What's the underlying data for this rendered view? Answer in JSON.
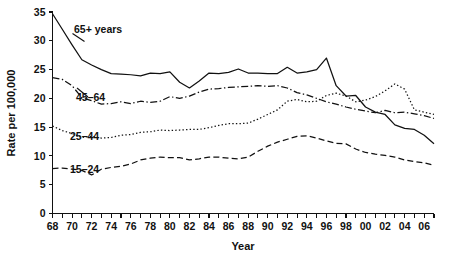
{
  "chart_data": {
    "type": "line",
    "title": "",
    "xlabel": "Year",
    "ylabel": "Rate per 100,000",
    "ylim": [
      0,
      35
    ],
    "xlim": [
      1968,
      2007
    ],
    "grid": false,
    "legend_position": "inline-labels",
    "y_ticks": [
      "0",
      "5",
      "10",
      "15",
      "20",
      "25",
      "30",
      "35"
    ],
    "y_tick_values": [
      0,
      5,
      10,
      15,
      20,
      25,
      30,
      35
    ],
    "x_ticks": [
      "68",
      "70",
      "72",
      "74",
      "76",
      "78",
      "80",
      "82",
      "84",
      "86",
      "88",
      "90",
      "92",
      "94",
      "96",
      "98",
      "00",
      "02",
      "04",
      "06"
    ],
    "x_tick_values": [
      1968,
      1970,
      1972,
      1974,
      1976,
      1978,
      1980,
      1982,
      1984,
      1986,
      1988,
      1990,
      1992,
      1994,
      1996,
      1998,
      2000,
      2002,
      2004,
      2006
    ],
    "x": [
      1968,
      1969,
      1970,
      1971,
      1972,
      1973,
      1974,
      1975,
      1976,
      1977,
      1978,
      1979,
      1980,
      1981,
      1982,
      1983,
      1984,
      1985,
      1986,
      1987,
      1988,
      1989,
      1990,
      1991,
      1992,
      1993,
      1994,
      1995,
      1996,
      1997,
      1998,
      1999,
      2000,
      2001,
      2002,
      2003,
      2004,
      2005,
      2006,
      2007
    ],
    "series": [
      {
        "name": "65+ years",
        "label": "65+ years",
        "style": "solid",
        "color": "#111111",
        "values": [
          34.7,
          32.0,
          29.3,
          26.7,
          25.8,
          25.0,
          24.3,
          24.2,
          24.1,
          23.9,
          24.4,
          24.3,
          24.6,
          22.8,
          21.8,
          23.0,
          24.4,
          24.3,
          24.5,
          25.1,
          24.4,
          24.4,
          24.3,
          24.3,
          25.4,
          24.4,
          24.6,
          25.0,
          27.0,
          22.2,
          20.4,
          20.5,
          18.5,
          17.6,
          17.2,
          15.4,
          14.8,
          14.1,
          14.7,
          15.2
        ],
        "final_values_note": [
          14.6,
          14.0,
          12.1
        ],
        "values_tail": [
          14.6,
          13.6,
          12.1
        ]
      },
      {
        "name": "45-64",
        "label": "45–64",
        "style": "dashdot",
        "color": "#111111",
        "values": [
          23.6,
          23.3,
          22.2,
          20.1,
          19.6,
          19.0,
          19.1,
          19.4,
          19.1,
          19.5,
          19.3,
          19.5,
          20.3,
          20.0,
          20.4,
          21.1,
          21.6,
          21.7,
          21.9,
          22.0,
          22.1,
          22.2,
          22.1,
          22.2,
          21.8,
          21.0,
          20.6,
          20.0,
          19.4,
          19.0,
          18.5,
          18.1,
          17.8,
          17.5,
          17.9,
          17.5,
          17.6,
          17.3,
          17.0,
          16.5
        ]
      },
      {
        "name": "25-44",
        "label": "25–44",
        "style": "dotted",
        "color": "#111111",
        "values": [
          15.2,
          14.4,
          13.9,
          13.2,
          13.4,
          13.1,
          13.2,
          13.6,
          13.7,
          14.1,
          14.2,
          14.5,
          14.4,
          14.5,
          14.6,
          14.6,
          14.9,
          15.3,
          15.6,
          15.6,
          15.7,
          16.4,
          17.2,
          18.0,
          19.5,
          19.8,
          19.4,
          19.5,
          20.5,
          20.9,
          20.4,
          19.4,
          19.7,
          20.3,
          21.3,
          22.5,
          21.6,
          20.8,
          19.9,
          18.4
        ],
        "values_tail": [
          18.0,
          17.6,
          17.2
        ]
      },
      {
        "name": "15-24",
        "label": "15–24",
        "style": "dashed",
        "color": "#111111",
        "values": [
          7.8,
          7.9,
          7.7,
          7.5,
          6.7,
          7.7,
          8.0,
          8.2,
          8.6,
          9.3,
          9.6,
          9.8,
          9.7,
          9.7,
          9.3,
          9.5,
          9.8,
          9.8,
          9.6,
          9.5,
          9.8,
          10.8,
          11.7,
          12.4,
          12.9,
          13.4,
          13.5,
          13.1,
          12.6,
          12.2,
          12.1,
          11.2,
          10.6,
          10.3,
          10.1,
          9.8,
          9.3,
          9.0,
          8.8,
          8.4
        ]
      }
    ]
  },
  "labels": {
    "y_axis_title": "Rate per 100,000",
    "x_axis_title": "Year",
    "series_65": "65+ years",
    "series_45": "45–64",
    "series_25": "25–44",
    "series_15": "15–24"
  }
}
